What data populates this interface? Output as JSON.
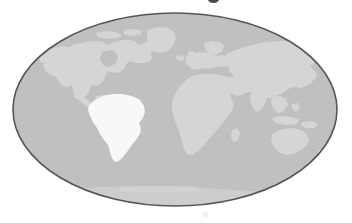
{
  "figure": {
    "name": "world-locator-map",
    "width": 352,
    "height": 223,
    "background_color": "#ffffff",
    "projection": "mollweide-ellipse"
  },
  "globe": {
    "center_x": 175,
    "center_y": 109.5,
    "radius_x": 162,
    "radius_y": 96.5,
    "ocean_color": "#c0c0c0",
    "outline_color": "#555555",
    "outline_width": 1.6
  },
  "colors": {
    "ocean": "#c0c0c0",
    "land": "#d5d5d5",
    "land_shadow": "#cacaca",
    "highlight": "#f8f8f6",
    "outline": "#555555",
    "page_background": "#ffffff",
    "crop_mark": "#4a4a4a"
  },
  "regions": [
    {
      "id": "north-america",
      "label": "North America",
      "highlighted": false,
      "fill": "#d5d5d5"
    },
    {
      "id": "greenland",
      "label": "Greenland",
      "highlighted": false,
      "fill": "#d5d5d5"
    },
    {
      "id": "central-america",
      "label": "Central America",
      "highlighted": false,
      "fill": "#d5d5d5"
    },
    {
      "id": "south-america",
      "label": "South America",
      "highlighted": true,
      "fill": "#f8f8f6"
    },
    {
      "id": "europe",
      "label": "Europe",
      "highlighted": false,
      "fill": "#d5d5d5"
    },
    {
      "id": "africa",
      "label": "Africa",
      "highlighted": false,
      "fill": "#d5d5d5"
    },
    {
      "id": "asia",
      "label": "Asia",
      "highlighted": false,
      "fill": "#d5d5d5"
    },
    {
      "id": "australia",
      "label": "Australia",
      "highlighted": false,
      "fill": "#d5d5d5"
    },
    {
      "id": "antarctica",
      "label": "Antarctica",
      "highlighted": false,
      "fill": "#cdcdcd"
    }
  ],
  "marks": {
    "top_crop_mark": "partial-glyph-cropped-at-top-edge",
    "bottom_crop_mark": "faint-mark-at-bottom-edge"
  }
}
